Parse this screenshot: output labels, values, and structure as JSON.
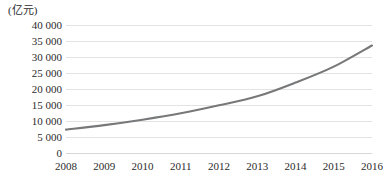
{
  "chart_data": {
    "type": "line",
    "title": "",
    "subtitle": "",
    "unit_label": "(亿元)",
    "xlabel": "",
    "ylabel": "",
    "categories": [
      "2008",
      "2009",
      "2010",
      "2011",
      "2012",
      "2013",
      "2014",
      "2015",
      "2016"
    ],
    "x": [
      2008,
      2009,
      2010,
      2011,
      2012,
      2013,
      2014,
      2015,
      2016
    ],
    "values": [
      7300,
      8700,
      10400,
      12400,
      14900,
      17700,
      22000,
      27000,
      33600
    ],
    "series": [
      {
        "name": "",
        "values": [
          7300,
          8700,
          10400,
          12400,
          14900,
          17700,
          22000,
          27000,
          33600
        ]
      }
    ],
    "ylim": [
      0,
      40000
    ],
    "y_ticks": [
      0,
      5000,
      10000,
      15000,
      20000,
      25000,
      30000,
      35000,
      40000
    ],
    "y_tick_labels": [
      "0",
      "5 000",
      "10 000",
      "15 000",
      "20 000",
      "25 000",
      "30 000",
      "35 000",
      "40 000"
    ],
    "grid": true,
    "grid_axis": "y",
    "legend": false,
    "legend_position": "none",
    "line_color": "#77787a",
    "grid_color": "#e3e3e3",
    "background_color": "#ffffff",
    "text_color": "#2b2b2b",
    "smooth": true,
    "markers": false,
    "annotations": []
  }
}
